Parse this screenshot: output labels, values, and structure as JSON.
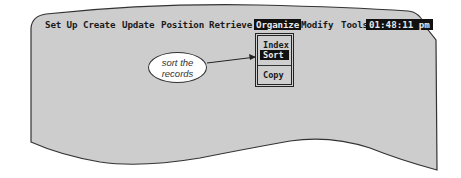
{
  "menubar": {
    "items": [
      {
        "label": "Set Up",
        "x": 0
      },
      {
        "label": "Create",
        "x": 38
      },
      {
        "label": "Update",
        "x": 77
      },
      {
        "label": "Position",
        "x": 116
      },
      {
        "label": "Retrieve",
        "x": 164
      },
      {
        "label": "Organize",
        "x": 211,
        "active": true
      },
      {
        "label": "Modify",
        "x": 256
      },
      {
        "label": "Tools",
        "x": 296
      }
    ],
    "clock": "01:48:11 pm"
  },
  "dropdown": {
    "items": [
      {
        "label": "Index",
        "selected": false
      },
      {
        "label": "Sort",
        "selected": true
      },
      {
        "label": "Copy",
        "selected": false
      }
    ]
  },
  "callout": {
    "line1": "sort the",
    "line2": "records"
  },
  "colors": {
    "screen": "#cdcdcd",
    "highlight": "#111111",
    "highlight_text": "#e8e8e8"
  }
}
